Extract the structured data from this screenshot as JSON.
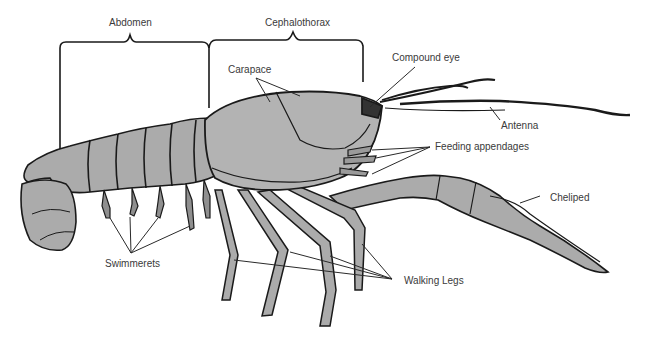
{
  "diagram": {
    "colors": {
      "body_fill": "#ababab",
      "outline": "#1a1a1a",
      "leader_line": "#2a2a2a",
      "label_text": "#3a3a3a",
      "background": "#ffffff"
    },
    "brackets": [
      {
        "label": "Abdomen"
      },
      {
        "label": "Cephalothorax"
      }
    ],
    "labels": {
      "abdomen": "Abdomen",
      "cephalothorax": "Cephalothorax",
      "carapace": "Carapace",
      "compound_eye": "Compound eye",
      "antenna": "Antenna",
      "feeding_appendages": "Feeding appendages",
      "cheliped": "Cheliped",
      "swimmerets": "Swimmerets",
      "walking_legs": "Walking Legs"
    }
  }
}
